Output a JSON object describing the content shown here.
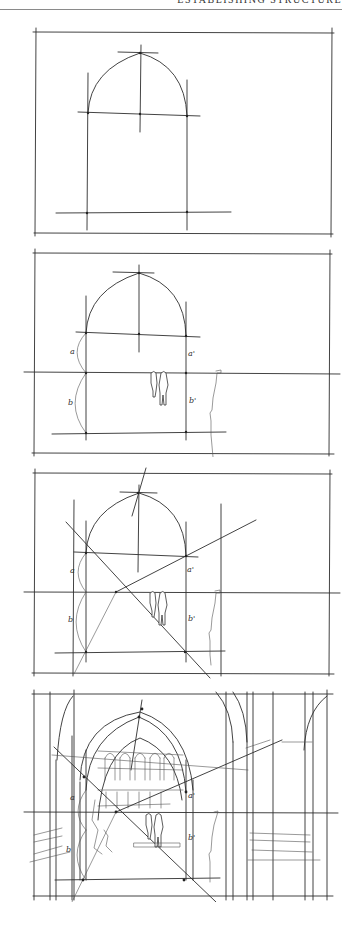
{
  "page": {
    "running_head": "ESTABLISHING STRUCTURE",
    "background": "#ffffff",
    "ink": "#2e2e2e"
  },
  "panels": [
    {
      "id": "step-1",
      "top": 24,
      "height": 216,
      "caption_labels": []
    },
    {
      "id": "step-2",
      "top": 245,
      "height": 212,
      "labels": {
        "a": "a",
        "a_prime": "a'",
        "b": "b",
        "b_prime": "b'"
      }
    },
    {
      "id": "step-3",
      "top": 465,
      "height": 215,
      "labels": {
        "a": "a",
        "a_prime": "a'",
        "b": "b",
        "b_prime": "b'"
      }
    },
    {
      "id": "step-4",
      "top": 686,
      "height": 216,
      "labels": {
        "a": "a",
        "a_prime": "a'",
        "b": "b",
        "b_prime": "b'"
      }
    }
  ]
}
